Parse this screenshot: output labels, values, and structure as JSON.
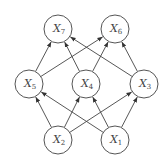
{
  "diagram": {
    "nodes": [
      {
        "id": "X7",
        "label": "X",
        "sub": "7",
        "x": 58,
        "y": 29
      },
      {
        "id": "X6",
        "label": "X",
        "sub": "6",
        "x": 115,
        "y": 29
      },
      {
        "id": "X5",
        "label": "X",
        "sub": "5",
        "x": 29,
        "y": 84
      },
      {
        "id": "X4",
        "label": "X",
        "sub": "4",
        "x": 86,
        "y": 84
      },
      {
        "id": "X3",
        "label": "X",
        "sub": "3",
        "x": 144,
        "y": 84
      },
      {
        "id": "X2",
        "label": "X",
        "sub": "2",
        "x": 58,
        "y": 140
      },
      {
        "id": "X1",
        "label": "X",
        "sub": "1",
        "x": 115,
        "y": 140
      }
    ],
    "edges": [
      {
        "from": "X5",
        "to": "X7"
      },
      {
        "from": "X5",
        "to": "X6"
      },
      {
        "from": "X4",
        "to": "X7"
      },
      {
        "from": "X4",
        "to": "X6"
      },
      {
        "from": "X3",
        "to": "X7"
      },
      {
        "from": "X3",
        "to": "X6"
      },
      {
        "from": "X2",
        "to": "X5"
      },
      {
        "from": "X2",
        "to": "X4"
      },
      {
        "from": "X2",
        "to": "X3"
      },
      {
        "from": "X1",
        "to": "X5"
      },
      {
        "from": "X1",
        "to": "X4"
      },
      {
        "from": "X1",
        "to": "X3"
      }
    ],
    "node_radius": 14,
    "colors": {
      "stroke": "#555555",
      "text": "#444444",
      "background": "#ffffff"
    }
  }
}
